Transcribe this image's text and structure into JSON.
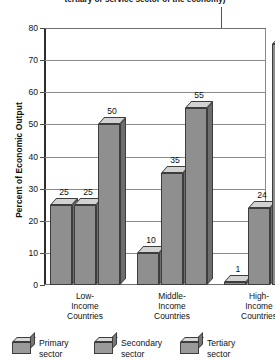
{
  "chart_data": {
    "type": "bar",
    "title": "tertiary or service sector of the economy)",
    "xlabel": "",
    "ylabel": "Percent of Economic Output",
    "ylim": [
      0,
      80
    ],
    "yticks": [
      0,
      10,
      20,
      30,
      40,
      50,
      60,
      70,
      80
    ],
    "grid": true,
    "legend_position": "bottom",
    "categories": [
      "Low-\nIncome\nCountries",
      "Middle-\nIncome\nCountries",
      "High-\nIncome\nCountries"
    ],
    "series": [
      {
        "name": "Primary\nsector",
        "values": [
          25,
          10,
          1
        ]
      },
      {
        "name": "Secondary\nsector",
        "values": [
          25,
          35,
          24
        ]
      },
      {
        "name": "Tertiary\nsector",
        "values": [
          50,
          55,
          75
        ]
      }
    ]
  },
  "axis": {
    "y_title": "Percent of Economic Output",
    "ticks": [
      "80",
      "70",
      "60",
      "50",
      "40",
      "30",
      "20",
      "10",
      "0"
    ]
  },
  "categories": [
    {
      "line1": "Low-",
      "line2": "Income",
      "line3": "Countries"
    },
    {
      "line1": "Middle-",
      "line2": "Income",
      "line3": "Countries"
    },
    {
      "line1": "High-",
      "line2": "Income",
      "line3": "Countries"
    }
  ],
  "bars": [
    {
      "value": 25,
      "label": "25",
      "group": "low",
      "series": "primary"
    },
    {
      "value": 25,
      "label": "25",
      "group": "low",
      "series": "secondary"
    },
    {
      "value": 50,
      "label": "50",
      "group": "low",
      "series": "tertiary"
    },
    {
      "value": 10,
      "label": "10",
      "group": "middle",
      "series": "primary"
    },
    {
      "value": 35,
      "label": "35",
      "group": "middle",
      "series": "secondary"
    },
    {
      "value": 55,
      "label": "55",
      "group": "middle",
      "series": "tertiary"
    },
    {
      "value": 1,
      "label": "1",
      "group": "high",
      "series": "primary"
    },
    {
      "value": 24,
      "label": "24",
      "group": "high",
      "series": "secondary"
    },
    {
      "value": 75,
      "label": "75",
      "group": "high",
      "series": "tertiary"
    }
  ],
  "legend": [
    {
      "line1": "Primary",
      "line2": "sector"
    },
    {
      "line1": "Secondary",
      "line2": "sector"
    },
    {
      "line1": "Tertiary",
      "line2": "sector"
    }
  ],
  "colors": {
    "bar_front": "#8f8f8f",
    "bar_top": "#d2d2d2",
    "bar_side": "#6d6d6d",
    "outline": "#3d3d3d",
    "gridline": "#8a8a8a",
    "axis": "#2e2e2e",
    "text": "#111111",
    "background": "#ffffff"
  }
}
